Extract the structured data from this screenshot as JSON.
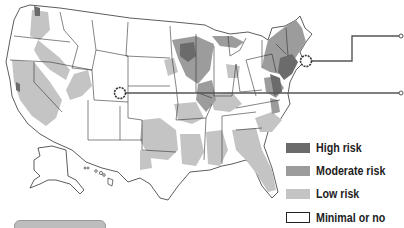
{
  "map": {
    "region": "United States",
    "colors": {
      "high": "#6b6b6b",
      "moderate": "#9c9c9c",
      "low": "#c4c4c4",
      "minimal": "#ffffff",
      "border": "#333333",
      "leader_line": "#555555"
    },
    "markers": [
      {
        "name": "colorado-marker",
        "label": "",
        "x": 120,
        "y": 93
      },
      {
        "name": "northeast-marker",
        "label": "",
        "x": 306,
        "y": 61
      }
    ]
  },
  "legend": {
    "items": [
      {
        "label": "High risk",
        "color": "#6b6b6b"
      },
      {
        "label": "Moderate risk",
        "color": "#9c9c9c"
      },
      {
        "label": "Low risk",
        "color": "#c4c4c4"
      },
      {
        "label": "Minimal or no risk",
        "color": "#ffffff"
      }
    ]
  }
}
